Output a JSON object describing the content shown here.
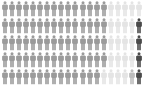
{
  "chart_data": {
    "type": "icon-array",
    "title": "",
    "icon": "person-icon",
    "rows": 5,
    "icons_per_row": 20,
    "colors": {
      "gray": "#9b9b9b",
      "light": "#e4e4e4",
      "medium": "#bdbdbd",
      "dark": "#4a4a4a"
    },
    "row_data": [
      [
        "gray",
        "gray",
        "gray",
        "gray",
        "gray",
        "gray",
        "gray",
        "gray",
        "gray",
        "gray",
        "gray",
        "gray",
        "gray",
        "gray",
        "gray",
        "light",
        "light",
        "light",
        "light",
        "light"
      ],
      [
        "gray",
        "gray",
        "gray",
        "gray",
        "gray",
        "gray",
        "gray",
        "gray",
        "gray",
        "gray",
        "gray",
        "gray",
        "gray",
        "gray",
        "gray",
        "light",
        "light",
        "light",
        "light",
        "dark"
      ],
      [
        "gray",
        "gray",
        "gray",
        "gray",
        "gray",
        "gray",
        "gray",
        "gray",
        "gray",
        "gray",
        "gray",
        "gray",
        "gray",
        "gray",
        "gray",
        "light",
        "light",
        "light",
        "light",
        "dark"
      ],
      [
        "gray",
        "gray",
        "gray",
        "gray",
        "gray",
        "gray",
        "gray",
        "gray",
        "gray",
        "gray",
        "gray",
        "gray",
        "gray",
        "gray",
        "gray",
        "light",
        "light",
        "light",
        "light",
        "dark"
      ],
      [
        "gray",
        "gray",
        "gray",
        "gray",
        "gray",
        "gray",
        "gray",
        "gray",
        "gray",
        "gray",
        "gray",
        "gray",
        "gray",
        "gray",
        "light",
        "light",
        "light",
        "light",
        "medium",
        "dark"
      ]
    ],
    "totals": {
      "gray": 74,
      "light": 21,
      "medium": 1,
      "dark": 4
    },
    "legend": []
  }
}
